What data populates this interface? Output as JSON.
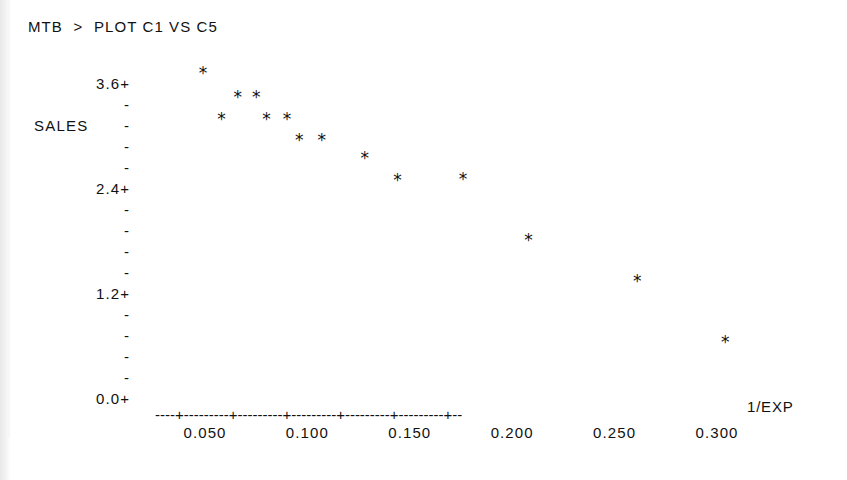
{
  "terminal": {
    "command_line": "MTB  >  PLOT C1 VS C5"
  },
  "chart_data": {
    "type": "scatter",
    "title": "",
    "xlabel": "1/EXP",
    "ylabel": "SALES",
    "xlim": [
      0.025,
      0.325
    ],
    "ylim": [
      0.0,
      3.9
    ],
    "grid": false,
    "legend": null,
    "marker": "*",
    "x_tick_labels": [
      "0.050",
      "0.100",
      "0.150",
      "0.200",
      "0.250",
      "0.300"
    ],
    "x_ticks": [
      0.05,
      0.1,
      0.15,
      0.2,
      0.25,
      0.3
    ],
    "y_tick_labels": [
      "3.6+",
      "-",
      "-",
      "-",
      "-",
      "2.4+",
      "-",
      "-",
      "-",
      "-",
      "1.2+",
      "-",
      "-",
      "-",
      "-",
      "0.0+"
    ],
    "y_major_labels": [
      "3.6",
      "2.4",
      "1.2",
      "0.0"
    ],
    "y_ticks": [
      3.6,
      2.4,
      1.2,
      0.0
    ],
    "x": [
      0.049,
      0.058,
      0.066,
      0.075,
      0.08,
      0.09,
      0.096,
      0.107,
      0.128,
      0.144,
      0.176,
      0.208,
      0.261,
      0.304
    ],
    "y": [
      3.71,
      3.19,
      3.44,
      3.44,
      3.19,
      3.19,
      2.95,
      2.95,
      2.74,
      2.49,
      2.5,
      1.81,
      1.34,
      0.64
    ],
    "points": [
      {
        "x": 0.049,
        "y": 3.71
      },
      {
        "x": 0.058,
        "y": 3.19
      },
      {
        "x": 0.066,
        "y": 3.44
      },
      {
        "x": 0.075,
        "y": 3.44
      },
      {
        "x": 0.08,
        "y": 3.19
      },
      {
        "x": 0.09,
        "y": 3.19
      },
      {
        "x": 0.096,
        "y": 2.95
      },
      {
        "x": 0.107,
        "y": 2.95
      },
      {
        "x": 0.128,
        "y": 2.74
      },
      {
        "x": 0.144,
        "y": 2.49
      },
      {
        "x": 0.176,
        "y": 2.5
      },
      {
        "x": 0.208,
        "y": 1.81
      },
      {
        "x": 0.261,
        "y": 1.34
      },
      {
        "x": 0.304,
        "y": 0.64
      }
    ],
    "axis_line_text": "----+---------+---------+---------+---------+---------+--"
  }
}
